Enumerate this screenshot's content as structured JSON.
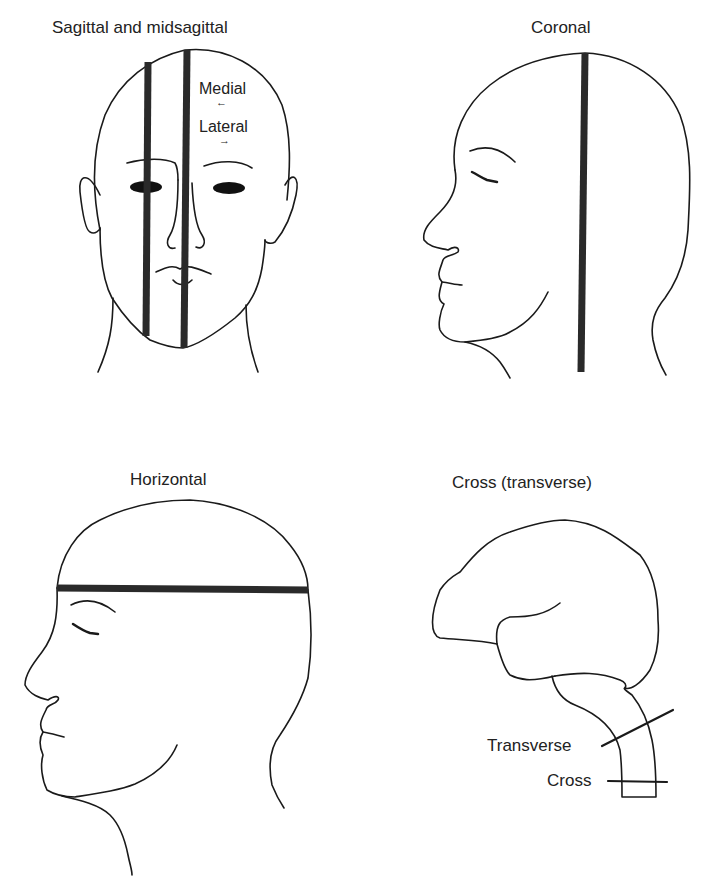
{
  "figure": {
    "panels": [
      {
        "id": "sagittal",
        "title": "Sagittal and midsagittal",
        "annotations": {
          "medial": "Medial",
          "medial_arrow": "←",
          "lateral": "Lateral",
          "lateral_arrow": "→"
        }
      },
      {
        "id": "coronal",
        "title": "Coronal"
      },
      {
        "id": "horizontal",
        "title": "Horizontal"
      },
      {
        "id": "cross",
        "title": "Cross (transverse)",
        "annotations": {
          "transverse": "Transverse",
          "cross": "Cross"
        }
      }
    ],
    "colors": {
      "background": "#ffffff",
      "line": "#1a1a1a",
      "plane": "#2a2a2a"
    }
  }
}
